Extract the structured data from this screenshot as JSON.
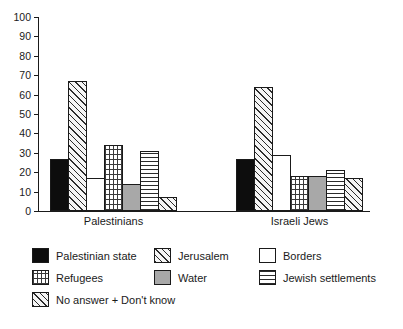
{
  "chart_data": {
    "type": "bar",
    "title": "",
    "subtitle": "",
    "xlabel": "",
    "ylabel": "",
    "ylim": [
      0,
      100
    ],
    "ytick_step": 10,
    "yticks": [
      0,
      10,
      20,
      30,
      40,
      50,
      60,
      70,
      80,
      90,
      100
    ],
    "grid": false,
    "legend_position": "bottom",
    "categories": [
      "Palestinians",
      "Israeli Jews"
    ],
    "series": [
      {
        "name": "Palestinian state",
        "pattern": "solid-black",
        "values": [
          27,
          27
        ]
      },
      {
        "name": "Jerusalem",
        "pattern": "diagonal-hatch",
        "values": [
          67,
          64
        ]
      },
      {
        "name": "Borders",
        "pattern": "white",
        "values": [
          17,
          29
        ]
      },
      {
        "name": "Refugees",
        "pattern": "dotted-grid",
        "values": [
          34,
          18
        ]
      },
      {
        "name": "Water",
        "pattern": "solid-gray",
        "values": [
          14,
          18
        ]
      },
      {
        "name": "Jewish settlements",
        "pattern": "horizontal-lines",
        "values": [
          31,
          21
        ]
      },
      {
        "name": "No answer + Don't know",
        "pattern": "diagonal-hatch",
        "values": [
          7,
          17
        ]
      }
    ]
  },
  "axis": {
    "y_tick_labels": [
      "0",
      "10",
      "20",
      "30",
      "40",
      "50",
      "60",
      "70",
      "80",
      "90",
      "100"
    ]
  },
  "categories": {
    "0": "Palestinians",
    "1": "Israeli Jews"
  },
  "legend": {
    "rows": [
      [
        {
          "label": "Palestinian state",
          "pattern": "solid-black"
        },
        {
          "label": "Jerusalem",
          "pattern": "diagonal-hatch"
        },
        {
          "label": "Borders",
          "pattern": "white"
        }
      ],
      [
        {
          "label": "Refugees",
          "pattern": "dotted-grid"
        },
        {
          "label": "Water",
          "pattern": "solid-gray"
        },
        {
          "label": "Jewish settlements",
          "pattern": "horizontal-lines"
        }
      ],
      [
        {
          "label": "No answer + Don't know",
          "pattern": "diagonal-hatch"
        }
      ]
    ]
  },
  "colors": {
    "axis": "#1a1a1a",
    "text": "#1a1a1a",
    "background": "#ffffff",
    "black_fill": "#0d0d0d",
    "gray_fill": "#a8a8a8",
    "hatch": "#2b2b2b"
  }
}
